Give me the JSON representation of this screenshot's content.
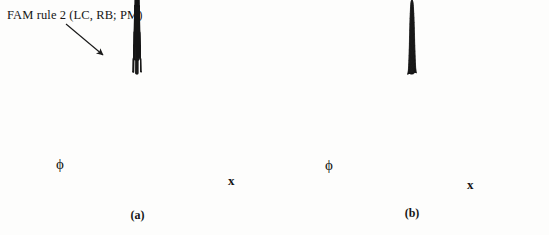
{
  "figure": {
    "width": 549,
    "height": 235,
    "background_color": "#fdfdfc",
    "ink_color": "#151515"
  },
  "panels": [
    {
      "id": "a",
      "caption": "(a)",
      "annotation": "FAM rule 2 (LC, RB; PM)",
      "annotation_pointer": "arrow-down-right",
      "axis_left_label": "ϕ",
      "axis_right_label": "x",
      "surface_type": "stepped-wireframe-mesh"
    },
    {
      "id": "b",
      "caption": "(b)",
      "annotation": "",
      "axis_left_label": "ϕ",
      "axis_right_label": "x",
      "surface_type": "smooth-wireframe-mesh"
    }
  ],
  "chart_data": {
    "type": "surface",
    "title": "",
    "subtitle": "",
    "xlabel": "x",
    "ylabel": "ϕ",
    "zlabel": "",
    "grid": false,
    "legend": "none",
    "annotations": [
      {
        "panel": "a",
        "text": "FAM rule 2 (LC, RB; PM)",
        "pointer": "arrow to upper-left terrace of stepped surface"
      }
    ],
    "panels": [
      {
        "id": "a",
        "caption": "(a)",
        "description": "Additive fuzzy system output surface built from quantized FAM rule patches; terraced plateaus and flat steps over the x-ϕ plane",
        "mesh_nx": 24,
        "mesh_ny": 24,
        "quantized": true,
        "levels": 6,
        "x_range": [
          0,
          1
        ],
        "y_range": [
          0,
          1
        ],
        "z_range": [
          0,
          1
        ]
      },
      {
        "id": "b",
        "caption": "(b)",
        "description": "Smoothed fuzzy system output surface; single broad sigmoidal plateau rising toward the far corner over the x-ϕ plane",
        "mesh_nx": 26,
        "mesh_ny": 26,
        "quantized": false,
        "x_range": [
          0,
          1
        ],
        "y_range": [
          0,
          1
        ],
        "z_range": [
          0,
          1
        ]
      }
    ]
  }
}
